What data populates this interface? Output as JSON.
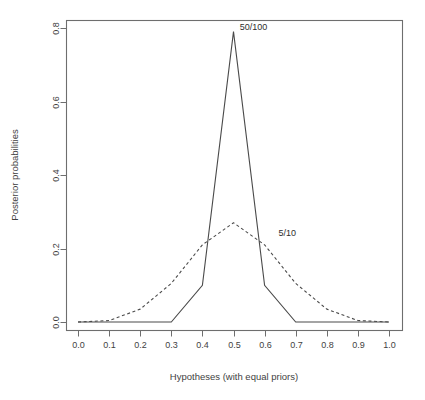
{
  "chart_data": {
    "type": "line",
    "title": "",
    "xlabel": "Hypotheses (with equal priors)",
    "ylabel": "Posterior probabilities",
    "xlim": [
      0.0,
      1.0
    ],
    "ylim": [
      0.0,
      0.8
    ],
    "grid": false,
    "legend_position": "inline-annotations",
    "xticks": [
      "0.0",
      "0.1",
      "0.2",
      "0.3",
      "0.4",
      "0.5",
      "0.6",
      "0.7",
      "0.8",
      "0.9",
      "1.0"
    ],
    "xtick_values": [
      0.0,
      0.1,
      0.2,
      0.3,
      0.4,
      0.5,
      0.6,
      0.7,
      0.8,
      0.9,
      1.0
    ],
    "yticks": [
      "0.0",
      "0.2",
      "0.4",
      "0.6",
      "0.8"
    ],
    "ytick_values": [
      0.0,
      0.2,
      0.4,
      0.6,
      0.8
    ],
    "x": [
      0.0,
      0.1,
      0.2,
      0.3,
      0.4,
      0.5,
      0.6,
      0.7,
      0.8,
      0.9,
      1.0
    ],
    "series": [
      {
        "name": "50/100",
        "style": "solid",
        "color": "#4a4a4a",
        "values": [
          0.0,
          0.0,
          0.0,
          0.0,
          0.1,
          0.79,
          0.1,
          0.0,
          0.0,
          0.0,
          0.0
        ],
        "annotation": "50/100",
        "annotation_x": 0.52,
        "annotation_y": 0.795
      },
      {
        "name": "5/10",
        "style": "dashed",
        "color": "#4a4a4a",
        "values": [
          0.0,
          0.004,
          0.035,
          0.105,
          0.21,
          0.27,
          0.21,
          0.105,
          0.035,
          0.004,
          0.0
        ],
        "annotation": "5/10",
        "annotation_x": 0.645,
        "annotation_y": 0.235
      }
    ],
    "colors": {
      "line": "#4a4a4a",
      "axis": "#6e6e6e",
      "text": "#3f3f3f",
      "background": "#ffffff"
    }
  }
}
